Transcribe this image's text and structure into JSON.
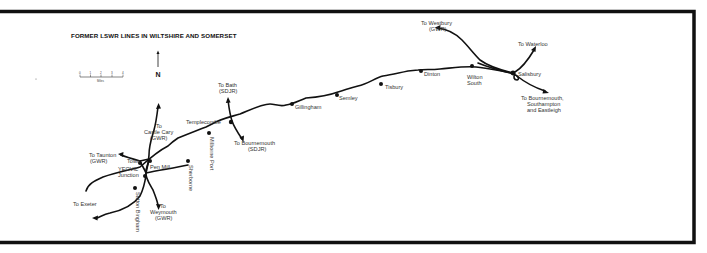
{
  "map": {
    "title": "FORMER LSWR LINES IN WILTSHIRE AND SOMERSET",
    "north_label": "N",
    "scale": {
      "ticks": [
        "0",
        "1",
        "2",
        "3",
        "4"
      ],
      "unit": "Miles"
    },
    "stations": {
      "salisbury": "Salisbury",
      "wilton_south_1": "Wilton",
      "wilton_south_2": "South",
      "dinton": "Dinton",
      "tisbury": "Tisbury",
      "semley": "Semley",
      "gillingham": "Gillingham",
      "templecombe": "Templecombe",
      "milborne_port": "Milborne Port",
      "sherborne": "Sherborne",
      "pen_mill": "Pen Mill",
      "town": "Town",
      "yeovil_junction_1": "YEOVIL",
      "yeovil_junction_2": "Junction",
      "sutton_bingham": "Sutton Bingham"
    },
    "destinations": {
      "westbury_1": "To Westbury",
      "westbury_2": "(GWR)",
      "waterloo": "To Waterloo",
      "bournemouth_east_1": "To Bournemouth,",
      "bournemouth_east_2": "Southampton",
      "bournemouth_east_3": "and Eastleigh",
      "bath_1": "To Bath",
      "bath_2": "(SDJR)",
      "bournemouth_sdjr_1": "To Bournemouth",
      "bournemouth_sdjr_2": "(SDJR)",
      "castle_cary_1": "To",
      "castle_cary_2": "Castle Cary",
      "castle_cary_3": "(GWR)",
      "taunton_1": "To Taunton",
      "taunton_2": "(GWR)",
      "exeter": "To Exeter",
      "weymouth_1": "To",
      "weymouth_2": "Weymouth",
      "weymouth_3": "(GWR)"
    },
    "colors": {
      "ink": "#111111",
      "label": "#333333",
      "background": "#ffffff"
    }
  }
}
